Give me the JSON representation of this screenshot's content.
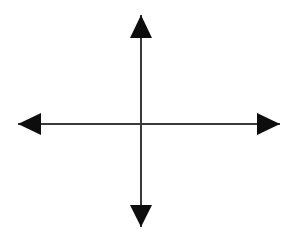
{
  "figure": {
    "background_color": "#ffffff",
    "canvas": {
      "width": 297,
      "height": 238
    }
  },
  "chart_data": {
    "type": "diagram",
    "title": "",
    "subtitle": "",
    "xlabel": "",
    "ylabel": "",
    "grid": false,
    "legend": null,
    "annotations": [],
    "tick_labels": {
      "x": [],
      "y": []
    },
    "axis_style": {
      "line_color": "#3a3a3a",
      "line_width": 2,
      "arrow_color": "#0d0d0d",
      "arrow_length": 23,
      "arrow_width": 22,
      "double_headed": true
    },
    "origin": {
      "x": 141,
      "y": 124
    },
    "axes": [
      {
        "name": "x-axis",
        "orientation": "horizontal",
        "start": {
          "x": 18,
          "y": 124
        },
        "end": {
          "x": 280,
          "y": 124
        },
        "arrow_start": true,
        "arrow_end": true,
        "length": 262
      },
      {
        "name": "y-axis",
        "orientation": "vertical",
        "start": {
          "x": 141,
          "y": 15
        },
        "end": {
          "x": 141,
          "y": 227
        },
        "arrow_start": true,
        "arrow_end": true,
        "length": 212
      }
    ],
    "arrowheads": [
      {
        "name": "up-arrowhead",
        "direction": "up",
        "tip": {
          "x": 141,
          "y": 15
        },
        "points": "141,15 152,38 130,38"
      },
      {
        "name": "down-arrowhead",
        "direction": "down",
        "tip": {
          "x": 141,
          "y": 227
        },
        "points": "141,227 152,205 130,205"
      },
      {
        "name": "left-arrowhead",
        "direction": "left",
        "tip": {
          "x": 18,
          "y": 124
        },
        "points": "18,124 41,113 41,135"
      },
      {
        "name": "right-arrowhead",
        "direction": "right",
        "tip": {
          "x": 280,
          "y": 124
        },
        "points": "280,124 257,113 257,135"
      }
    ]
  }
}
